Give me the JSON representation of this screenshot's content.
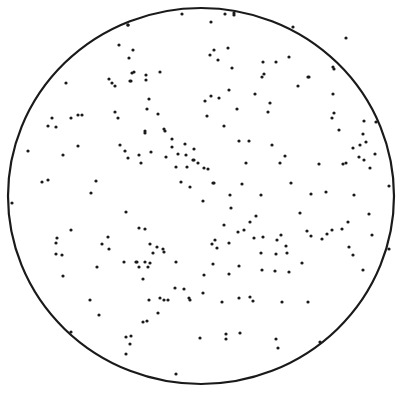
{
  "figure": {
    "width": 403,
    "height": 399,
    "background": "#ffffff",
    "ink": "#1a1a1a",
    "circle": {
      "cx": 201,
      "cy": 196,
      "rx": 193,
      "ry": 188,
      "stroke_width": 2.2
    },
    "dot_radius": 1.6,
    "dots": [
      [
        182,
        14
      ],
      [
        234,
        13
      ],
      [
        128,
        25
      ],
      [
        211,
        22
      ],
      [
        128,
        25
      ],
      [
        228,
        48
      ],
      [
        66,
        83
      ],
      [
        129,
        58
      ],
      [
        119,
        45
      ],
      [
        133,
        50
      ],
      [
        134,
        72
      ],
      [
        109,
        79
      ],
      [
        112,
        83
      ],
      [
        131,
        81
      ],
      [
        160,
        72
      ],
      [
        146,
        75
      ],
      [
        132,
        73
      ],
      [
        130,
        81
      ],
      [
        146,
        80
      ],
      [
        82,
        115
      ],
      [
        115,
        112
      ],
      [
        118,
        118
      ],
      [
        145,
        133
      ],
      [
        145,
        131
      ],
      [
        115,
        86
      ],
      [
        149,
        99
      ],
      [
        158,
        114
      ],
      [
        147,
        109
      ],
      [
        52,
        118
      ],
      [
        48,
        126
      ],
      [
        56,
        127
      ],
      [
        78,
        115
      ],
      [
        71,
        118
      ],
      [
        78,
        146
      ],
      [
        28,
        151
      ],
      [
        63,
        155
      ],
      [
        120,
        145
      ],
      [
        125,
        151
      ],
      [
        128,
        158
      ],
      [
        139,
        155
      ],
      [
        141,
        163
      ],
      [
        151,
        152
      ],
      [
        164,
        129
      ],
      [
        165,
        131
      ],
      [
        172,
        139
      ],
      [
        172,
        147
      ],
      [
        166,
        157
      ],
      [
        178,
        154
      ],
      [
        185,
        144
      ],
      [
        186,
        155
      ],
      [
        194,
        149
      ],
      [
        193,
        160
      ],
      [
        176,
        167
      ],
      [
        187,
        167
      ],
      [
        181,
        182
      ],
      [
        190,
        187
      ],
      [
        194,
        160
      ],
      [
        198,
        163
      ],
      [
        42,
        182
      ],
      [
        48,
        180
      ],
      [
        96,
        181
      ],
      [
        91,
        193
      ],
      [
        225,
        14
      ],
      [
        234,
        15
      ],
      [
        293,
        27
      ],
      [
        210,
        55
      ],
      [
        214,
        50
      ],
      [
        218,
        60
      ],
      [
        232,
        68
      ],
      [
        276,
        62
      ],
      [
        289,
        57
      ],
      [
        263,
        62
      ],
      [
        262,
        77
      ],
      [
        264,
        74
      ],
      [
        308,
        77
      ],
      [
        298,
        86
      ],
      [
        205,
        101
      ],
      [
        211,
        96
      ],
      [
        219,
        98
      ],
      [
        229,
        90
      ],
      [
        255,
        94
      ],
      [
        270,
        103
      ],
      [
        268,
        112
      ],
      [
        237,
        109
      ],
      [
        207,
        116
      ],
      [
        224,
        126
      ],
      [
        239,
        141
      ],
      [
        249,
        141
      ],
      [
        272,
        145
      ],
      [
        246,
        163
      ],
      [
        280,
        163
      ],
      [
        285,
        156
      ],
      [
        204,
        168
      ],
      [
        208,
        169
      ],
      [
        242,
        184
      ],
      [
        213,
        183
      ],
      [
        346,
        38
      ],
      [
        334,
        69
      ],
      [
        333,
        67
      ],
      [
        309,
        77
      ],
      [
        333,
        94
      ],
      [
        334,
        113
      ],
      [
        332,
        118
      ],
      [
        339,
        130
      ],
      [
        364,
        121
      ],
      [
        376,
        122
      ],
      [
        363,
        134
      ],
      [
        353,
        148
      ],
      [
        360,
        145
      ],
      [
        366,
        142
      ],
      [
        343,
        164
      ],
      [
        359,
        157
      ],
      [
        364,
        160
      ],
      [
        375,
        154
      ],
      [
        370,
        168
      ],
      [
        319,
        164
      ],
      [
        346,
        163
      ],
      [
        291,
        183
      ],
      [
        389,
        186
      ],
      [
        326,
        192
      ],
      [
        354,
        195
      ],
      [
        230,
        195
      ],
      [
        214,
        183
      ],
      [
        261,
        195
      ],
      [
        311,
        194
      ],
      [
        12,
        203
      ],
      [
        126,
        212
      ],
      [
        57,
        238
      ],
      [
        56,
        243
      ],
      [
        71,
        230
      ],
      [
        56,
        254
      ],
      [
        62,
        255
      ],
      [
        63,
        276
      ],
      [
        97,
        267
      ],
      [
        109,
        249
      ],
      [
        102,
        244
      ],
      [
        108,
        237
      ],
      [
        157,
        247
      ],
      [
        150,
        244
      ],
      [
        153,
        253
      ],
      [
        139,
        228
      ],
      [
        145,
        229
      ],
      [
        150,
        263
      ],
      [
        164,
        252
      ],
      [
        163,
        249
      ],
      [
        137,
        262
      ],
      [
        139,
        267
      ],
      [
        124,
        262
      ],
      [
        136,
        262
      ],
      [
        145,
        262
      ],
      [
        148,
        267
      ],
      [
        143,
        279
      ],
      [
        149,
        300
      ],
      [
        164,
        300
      ],
      [
        160,
        298
      ],
      [
        176,
        262
      ],
      [
        168,
        300
      ],
      [
        189,
        298
      ],
      [
        190,
        300
      ],
      [
        175,
        288
      ],
      [
        184,
        289
      ],
      [
        126,
        354
      ],
      [
        130,
        344
      ],
      [
        131,
        336
      ],
      [
        90,
        300
      ],
      [
        99,
        315
      ],
      [
        71,
        332
      ],
      [
        176,
        374
      ],
      [
        143,
        322
      ],
      [
        147,
        321
      ],
      [
        126,
        337
      ],
      [
        158,
        313
      ],
      [
        203,
        201
      ],
      [
        231,
        208
      ],
      [
        250,
        222
      ],
      [
        256,
        216
      ],
      [
        244,
        230
      ],
      [
        238,
        232
      ],
      [
        254,
        238
      ],
      [
        224,
        225
      ],
      [
        215,
        240
      ],
      [
        212,
        244
      ],
      [
        217,
        248
      ],
      [
        229,
        243
      ],
      [
        263,
        237
      ],
      [
        281,
        235
      ],
      [
        277,
        240
      ],
      [
        286,
        246
      ],
      [
        276,
        254
      ],
      [
        287,
        253
      ],
      [
        261,
        253
      ],
      [
        262,
        270
      ],
      [
        239,
        266
      ],
      [
        229,
        274
      ],
      [
        275,
        271
      ],
      [
        289,
        272
      ],
      [
        302,
        263
      ],
      [
        327,
        234
      ],
      [
        322,
        239
      ],
      [
        332,
        230
      ],
      [
        342,
        229
      ],
      [
        348,
        222
      ],
      [
        300,
        213
      ],
      [
        307,
        231
      ],
      [
        311,
        236
      ],
      [
        349,
        247
      ],
      [
        369,
        214
      ],
      [
        372,
        235
      ],
      [
        389,
        249
      ],
      [
        353,
        255
      ],
      [
        363,
        270
      ],
      [
        250,
        297
      ],
      [
        222,
        302
      ],
      [
        203,
        293
      ],
      [
        204,
        275
      ],
      [
        239,
        298
      ],
      [
        253,
        301
      ],
      [
        282,
        302
      ],
      [
        308,
        302
      ],
      [
        240,
        333
      ],
      [
        226,
        339
      ],
      [
        226,
        334
      ],
      [
        276,
        339
      ],
      [
        278,
        348
      ],
      [
        320,
        342
      ],
      [
        213,
        264
      ],
      [
        200,
        338
      ]
    ]
  }
}
